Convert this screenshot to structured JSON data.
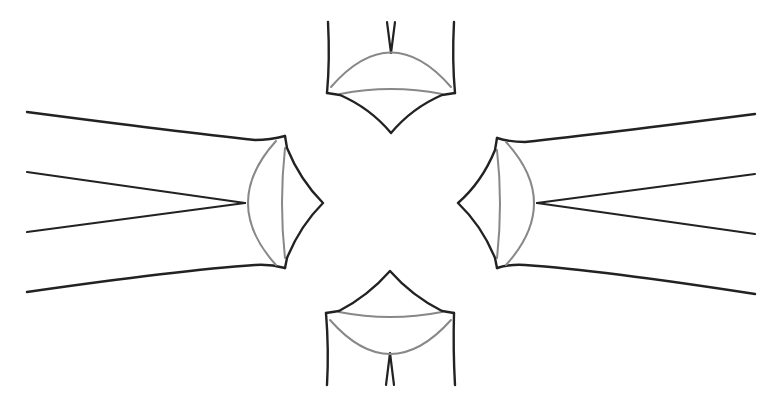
{
  "diagram": {
    "title": "",
    "colors": {
      "background": "#ffffff",
      "primary_stroke": "#222222",
      "secondary_stroke": "#888888"
    },
    "stroke_widths": {
      "primary": 2.4,
      "secondary": 2.0
    },
    "elements": [
      {
        "id": "top",
        "orientation": "down",
        "tip": [
          391,
          133
        ],
        "corners": [
          [
            328,
            93
          ],
          [
            454,
            93
          ]
        ],
        "arc_apex": [
          391,
          53
        ],
        "chord_y": 90,
        "lines": [
          {
            "from": [
              328,
              22
            ],
            "to": [
              327,
              93
            ]
          },
          {
            "from": [
              454,
              22
            ],
            "to": [
              455,
              93
            ]
          },
          {
            "from": [
              387,
              22
            ],
            "to": [
              391,
              53
            ]
          },
          {
            "from": [
              395,
              22
            ],
            "to": [
              391,
              53
            ]
          }
        ]
      },
      {
        "id": "left",
        "orientation": "right",
        "tip": [
          323,
          203
        ],
        "corners": [
          [
            285,
            136
          ],
          [
            285,
            268
          ]
        ],
        "arc_apex": [
          245,
          203
        ],
        "chord_x": 283,
        "lines": [
          {
            "from": [
              27,
              112
            ],
            "to": [
              285,
              136
            ]
          },
          {
            "from": [
              27,
              172
            ],
            "to": [
              245,
              203
            ]
          },
          {
            "from": [
              27,
              232
            ],
            "to": [
              245,
              203
            ]
          },
          {
            "from": [
              27,
              292
            ],
            "to": [
              285,
              268
            ]
          }
        ]
      },
      {
        "id": "right",
        "orientation": "left",
        "tip": [
          458,
          203
        ],
        "corners": [
          [
            497,
            138
          ],
          [
            497,
            268
          ]
        ],
        "arc_apex": [
          537,
          203
        ],
        "chord_x": 499,
        "lines": [
          {
            "from": [
              755,
              114
            ],
            "to": [
              497,
              138
            ]
          },
          {
            "from": [
              755,
              174
            ],
            "to": [
              537,
              203
            ]
          },
          {
            "from": [
              755,
              234
            ],
            "to": [
              537,
              203
            ]
          },
          {
            "from": [
              755,
              294
            ],
            "to": [
              497,
              268
            ]
          }
        ]
      },
      {
        "id": "bottom",
        "orientation": "up",
        "tip": [
          390,
          271
        ],
        "corners": [
          [
            326,
            313
          ],
          [
            454,
            313
          ]
        ],
        "arc_apex": [
          390,
          353
        ],
        "chord_y": 316,
        "lines": [
          {
            "from": [
              327,
              385
            ],
            "to": [
              326,
              313
            ]
          },
          {
            "from": [
              455,
              385
            ],
            "to": [
              454,
              313
            ]
          },
          {
            "from": [
              386,
              385
            ],
            "to": [
              390,
              353
            ]
          },
          {
            "from": [
              394,
              385
            ],
            "to": [
              390,
              353
            ]
          }
        ]
      }
    ]
  }
}
